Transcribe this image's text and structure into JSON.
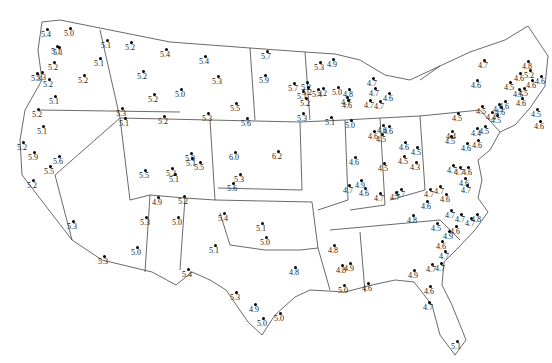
{
  "map": {
    "region": "Contiguous United States",
    "points": [
      {
        "x": 47,
        "y": 29,
        "v": "5.4"
      },
      {
        "x": 70,
        "y": 28,
        "v": "5.0"
      },
      {
        "x": 57,
        "y": 46,
        "v": "5.1"
      },
      {
        "x": 59,
        "y": 47,
        "v": "5.1"
      },
      {
        "x": 54,
        "y": 62,
        "v": "5.2"
      },
      {
        "x": 42,
        "y": 72,
        "v": "5.3"
      },
      {
        "x": 37,
        "y": 73,
        "v": "5.3"
      },
      {
        "x": 49,
        "y": 79,
        "v": "5.2"
      },
      {
        "x": 84,
        "y": 75,
        "v": "5.2"
      },
      {
        "x": 55,
        "y": 96,
        "v": "5.1"
      },
      {
        "x": 38,
        "y": 109,
        "v": "5.2"
      },
      {
        "x": 107,
        "y": 40,
        "v": "5.1"
      },
      {
        "x": 100,
        "y": 58,
        "v": "5.1"
      },
      {
        "x": 131,
        "y": 42,
        "v": "5.2"
      },
      {
        "x": 166,
        "y": 49,
        "v": "5.4"
      },
      {
        "x": 205,
        "y": 56,
        "v": "5.4"
      },
      {
        "x": 143,
        "y": 71,
        "v": "5.2"
      },
      {
        "x": 122,
        "y": 108,
        "v": "5.3"
      },
      {
        "x": 181,
        "y": 89,
        "v": "5.0"
      },
      {
        "x": 154,
        "y": 94,
        "v": "5.2"
      },
      {
        "x": 218,
        "y": 76,
        "v": "5.3"
      },
      {
        "x": 43,
        "y": 126,
        "v": "5.1"
      },
      {
        "x": 23,
        "y": 142,
        "v": "5.2"
      },
      {
        "x": 34,
        "y": 152,
        "v": "5.9"
      },
      {
        "x": 59,
        "y": 156,
        "v": "5.6"
      },
      {
        "x": 50,
        "y": 166,
        "v": "5.5"
      },
      {
        "x": 33,
        "y": 180,
        "v": "5.2"
      },
      {
        "x": 73,
        "y": 221,
        "v": "5.3"
      },
      {
        "x": 104,
        "y": 256,
        "v": "5.3"
      },
      {
        "x": 137,
        "y": 247,
        "v": "5.0"
      },
      {
        "x": 125,
        "y": 118,
        "v": "5.1"
      },
      {
        "x": 164,
        "y": 116,
        "v": "5.2"
      },
      {
        "x": 208,
        "y": 113,
        "v": "5.3"
      },
      {
        "x": 236,
        "y": 103,
        "v": "5.5"
      },
      {
        "x": 265,
        "y": 75,
        "v": "5.9"
      },
      {
        "x": 267,
        "y": 51,
        "v": "5.7"
      },
      {
        "x": 145,
        "y": 170,
        "v": "5.5"
      },
      {
        "x": 191,
        "y": 153,
        "v": "5.0"
      },
      {
        "x": 200,
        "y": 162,
        "v": "5.5"
      },
      {
        "x": 192,
        "y": 158,
        "v": "5.1"
      },
      {
        "x": 172,
        "y": 168,
        "v": "5.2"
      },
      {
        "x": 175,
        "y": 174,
        "v": "5.1"
      },
      {
        "x": 184,
        "y": 196,
        "v": "5.2"
      },
      {
        "x": 158,
        "y": 197,
        "v": "4.9"
      },
      {
        "x": 235,
        "y": 152,
        "v": "6.0"
      },
      {
        "x": 278,
        "y": 151,
        "v": "6.2"
      },
      {
        "x": 233,
        "y": 183,
        "v": "5.6"
      },
      {
        "x": 224,
        "y": 213,
        "v": "5.4"
      },
      {
        "x": 146,
        "y": 217,
        "v": "5.3"
      },
      {
        "x": 178,
        "y": 217,
        "v": "5.0"
      },
      {
        "x": 262,
        "y": 223,
        "v": "5.1"
      },
      {
        "x": 266,
        "y": 237,
        "v": "5.0"
      },
      {
        "x": 188,
        "y": 269,
        "v": "5.4"
      },
      {
        "x": 236,
        "y": 292,
        "v": "5.3"
      },
      {
        "x": 255,
        "y": 304,
        "v": "4.9"
      },
      {
        "x": 280,
        "y": 313,
        "v": "5.0"
      },
      {
        "x": 263,
        "y": 318,
        "v": "5.0"
      },
      {
        "x": 295,
        "y": 267,
        "v": "4.8"
      },
      {
        "x": 240,
        "y": 174,
        "v": "5.3"
      },
      {
        "x": 215,
        "y": 245,
        "v": "5.1"
      },
      {
        "x": 247,
        "y": 118,
        "v": "5.6"
      },
      {
        "x": 303,
        "y": 113,
        "v": "5.3"
      },
      {
        "x": 307,
        "y": 82,
        "v": "5.2"
      },
      {
        "x": 303,
        "y": 91,
        "v": "5.1"
      },
      {
        "x": 294,
        "y": 83,
        "v": "5.7"
      },
      {
        "x": 308,
        "y": 87,
        "v": "5.2"
      },
      {
        "x": 306,
        "y": 98,
        "v": "5.2"
      },
      {
        "x": 320,
        "y": 62,
        "v": "5.3"
      },
      {
        "x": 333,
        "y": 59,
        "v": "4.9"
      },
      {
        "x": 318,
        "y": 89,
        "v": "5.4"
      },
      {
        "x": 323,
        "y": 88,
        "v": "5.2"
      },
      {
        "x": 338,
        "y": 87,
        "v": "5.0"
      },
      {
        "x": 349,
        "y": 89,
        "v": "4.8"
      },
      {
        "x": 347,
        "y": 97,
        "v": "4.7"
      },
      {
        "x": 348,
        "y": 100,
        "v": "4.6"
      },
      {
        "x": 331,
        "y": 117,
        "v": "5.1"
      },
      {
        "x": 351,
        "y": 120,
        "v": "5.0"
      },
      {
        "x": 370,
        "y": 100,
        "v": "4.7"
      },
      {
        "x": 380,
        "y": 101,
        "v": "4.7"
      },
      {
        "x": 375,
        "y": 88,
        "v": "4.7"
      },
      {
        "x": 373,
        "y": 78,
        "v": "4.7"
      },
      {
        "x": 389,
        "y": 93,
        "v": "4.6"
      },
      {
        "x": 374,
        "y": 131,
        "v": "4.6"
      },
      {
        "x": 382,
        "y": 134,
        "v": "4.5"
      },
      {
        "x": 383,
        "y": 125,
        "v": "4.6"
      },
      {
        "x": 389,
        "y": 126,
        "v": "4.6"
      },
      {
        "x": 355,
        "y": 157,
        "v": "4.6"
      },
      {
        "x": 384,
        "y": 163,
        "v": "4.5"
      },
      {
        "x": 361,
        "y": 180,
        "v": "4.9"
      },
      {
        "x": 349,
        "y": 185,
        "v": "4.7"
      },
      {
        "x": 365,
        "y": 188,
        "v": "4.6"
      },
      {
        "x": 380,
        "y": 193,
        "v": "4.7"
      },
      {
        "x": 396,
        "y": 192,
        "v": "4.7"
      },
      {
        "x": 401,
        "y": 189,
        "v": "4.7"
      },
      {
        "x": 404,
        "y": 156,
        "v": "4.5"
      },
      {
        "x": 405,
        "y": 142,
        "v": "4.6"
      },
      {
        "x": 417,
        "y": 147,
        "v": "4.5"
      },
      {
        "x": 416,
        "y": 162,
        "v": "4.3"
      },
      {
        "x": 430,
        "y": 189,
        "v": "4.7"
      },
      {
        "x": 440,
        "y": 186,
        "v": "4.7"
      },
      {
        "x": 446,
        "y": 194,
        "v": "4.6"
      },
      {
        "x": 427,
        "y": 201,
        "v": "4.6"
      },
      {
        "x": 413,
        "y": 215,
        "v": "4.8"
      },
      {
        "x": 334,
        "y": 245,
        "v": "4.8"
      },
      {
        "x": 342,
        "y": 265,
        "v": "4.8"
      },
      {
        "x": 350,
        "y": 263,
        "v": "4.9"
      },
      {
        "x": 344,
        "y": 285,
        "v": "5.0"
      },
      {
        "x": 368,
        "y": 283,
        "v": "4.6"
      },
      {
        "x": 414,
        "y": 270,
        "v": "4.9"
      },
      {
        "x": 441,
        "y": 263,
        "v": "4.7"
      },
      {
        "x": 432,
        "y": 264,
        "v": "4.7"
      },
      {
        "x": 430,
        "y": 286,
        "v": "4.6"
      },
      {
        "x": 429,
        "y": 302,
        "v": "4.7"
      },
      {
        "x": 457,
        "y": 341,
        "v": "5.1"
      },
      {
        "x": 442,
        "y": 241,
        "v": "4.6"
      },
      {
        "x": 445,
        "y": 251,
        "v": "4.7"
      },
      {
        "x": 437,
        "y": 223,
        "v": "4.5"
      },
      {
        "x": 449,
        "y": 231,
        "v": "4.9"
      },
      {
        "x": 456,
        "y": 226,
        "v": "4.6"
      },
      {
        "x": 461,
        "y": 214,
        "v": "4.7"
      },
      {
        "x": 471,
        "y": 218,
        "v": "4.7"
      },
      {
        "x": 477,
        "y": 214,
        "v": "4.8"
      },
      {
        "x": 451,
        "y": 210,
        "v": "4.7"
      },
      {
        "x": 465,
        "y": 178,
        "v": "4.6"
      },
      {
        "x": 468,
        "y": 167,
        "v": "4.6"
      },
      {
        "x": 460,
        "y": 167,
        "v": "4.7"
      },
      {
        "x": 453,
        "y": 165,
        "v": "4.7"
      },
      {
        "x": 467,
        "y": 185,
        "v": "4.7"
      },
      {
        "x": 452,
        "y": 131,
        "v": "4.4"
      },
      {
        "x": 451,
        "y": 136,
        "v": "4.5"
      },
      {
        "x": 467,
        "y": 143,
        "v": "4.6"
      },
      {
        "x": 478,
        "y": 140,
        "v": "4.6"
      },
      {
        "x": 477,
        "y": 128,
        "v": "4.4"
      },
      {
        "x": 485,
        "y": 126,
        "v": "4.5"
      },
      {
        "x": 482,
        "y": 106,
        "v": "4.5"
      },
      {
        "x": 492,
        "y": 112,
        "v": "4.4"
      },
      {
        "x": 497,
        "y": 115,
        "v": "4.5"
      },
      {
        "x": 501,
        "y": 107,
        "v": "4.6"
      },
      {
        "x": 484,
        "y": 60,
        "v": "4.7"
      },
      {
        "x": 477,
        "y": 80,
        "v": "4.6"
      },
      {
        "x": 458,
        "y": 113,
        "v": "4.5"
      },
      {
        "x": 505,
        "y": 101,
        "v": "4.6"
      },
      {
        "x": 499,
        "y": 104,
        "v": "4.5"
      },
      {
        "x": 510,
        "y": 82,
        "v": "4.5"
      },
      {
        "x": 524,
        "y": 88,
        "v": "4.5"
      },
      {
        "x": 522,
        "y": 98,
        "v": "4.6"
      },
      {
        "x": 528,
        "y": 61,
        "v": "4.8"
      },
      {
        "x": 530,
        "y": 70,
        "v": "5.2"
      },
      {
        "x": 532,
        "y": 80,
        "v": "4.6"
      },
      {
        "x": 541,
        "y": 76,
        "v": "4.6"
      },
      {
        "x": 520,
        "y": 73,
        "v": "4.6"
      },
      {
        "x": 519,
        "y": 89,
        "v": "4.5"
      },
      {
        "x": 537,
        "y": 109,
        "v": "4.5"
      },
      {
        "x": 540,
        "y": 121,
        "v": "4.6"
      }
    ]
  }
}
